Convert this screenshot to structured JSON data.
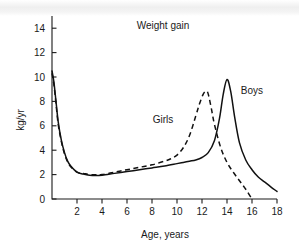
{
  "chart_data": {
    "type": "line",
    "title": "Weight gain",
    "xlabel": "Age, years",
    "ylabel": "kg/yr",
    "xlim": [
      0,
      18
    ],
    "ylim": [
      0,
      15
    ],
    "grid": false,
    "legend_position": "inline-annotations",
    "xticks": [
      2,
      4,
      6,
      8,
      10,
      12,
      14,
      16,
      18
    ],
    "xtick_labels": [
      "2",
      "4",
      "6",
      "8",
      "10",
      "12",
      "14",
      "16",
      "18"
    ],
    "yticks": [
      0,
      2,
      4,
      6,
      8,
      10,
      12,
      14
    ],
    "ytick_labels": [
      "0",
      "2",
      "4",
      "6",
      "8",
      "10",
      "12",
      "14"
    ],
    "series": [
      {
        "name": "Boys",
        "style": "solid",
        "annotation": "Boys",
        "x": [
          0.0,
          0.15,
          0.3,
          0.5,
          0.75,
          1.0,
          1.25,
          1.5,
          2.0,
          2.5,
          3.0,
          3.5,
          4.0,
          5.0,
          6.0,
          7.0,
          8.0,
          9.0,
          10.0,
          10.5,
          11.0,
          11.5,
          12.0,
          12.5,
          13.0,
          13.4,
          13.7,
          14.0,
          14.3,
          14.6,
          15.0,
          15.5,
          16.0,
          16.5,
          17.0,
          17.5,
          18.0
        ],
        "y": [
          10.5,
          9.6,
          8.2,
          6.3,
          4.8,
          3.8,
          3.1,
          2.7,
          2.2,
          2.05,
          1.95,
          1.92,
          1.95,
          2.1,
          2.25,
          2.4,
          2.55,
          2.7,
          2.9,
          3.0,
          3.1,
          3.2,
          3.4,
          3.8,
          4.8,
          6.6,
          8.6,
          9.8,
          8.8,
          6.8,
          4.6,
          3.2,
          2.4,
          1.8,
          1.4,
          1.0,
          0.62
        ]
      },
      {
        "name": "Girls",
        "style": "dashed",
        "annotation": "Girls",
        "x": [
          0.0,
          0.15,
          0.3,
          0.5,
          0.75,
          1.0,
          1.25,
          1.5,
          2.0,
          2.5,
          3.0,
          3.5,
          4.0,
          5.0,
          6.0,
          7.0,
          8.0,
          9.0,
          9.5,
          10.0,
          10.5,
          11.0,
          11.5,
          11.8,
          12.1,
          12.35,
          12.5,
          12.75,
          13.0,
          13.5,
          14.0,
          14.5,
          15.0,
          15.5,
          16.0
        ],
        "y": [
          10.3,
          9.4,
          8.0,
          6.1,
          4.7,
          3.7,
          3.05,
          2.65,
          2.2,
          2.1,
          2.0,
          1.98,
          2.0,
          2.2,
          2.4,
          2.6,
          2.8,
          3.1,
          3.3,
          3.6,
          4.2,
          5.2,
          6.8,
          7.8,
          8.6,
          8.85,
          8.6,
          7.4,
          6.1,
          4.2,
          3.0,
          2.2,
          1.5,
          0.8,
          0.0
        ]
      }
    ],
    "annotations": [
      {
        "text": "Boys",
        "x": 15.1,
        "y": 8.6
      },
      {
        "text": "Girls",
        "x": 9.7,
        "y": 6.2
      }
    ],
    "colors": {
      "line": "#111111",
      "axis": "#1a1a1a",
      "background": "#ffffff"
    }
  }
}
